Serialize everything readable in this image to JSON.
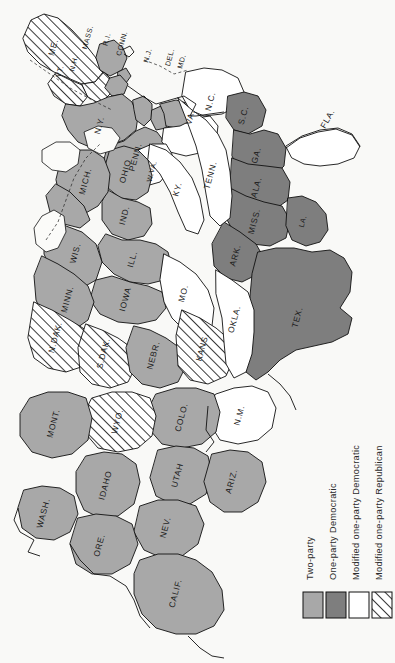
{
  "map": {
    "title": "United States party competition map",
    "orientation": "rotated-90-counterclockwise",
    "background_color": "#f9f9f7",
    "outline_color": "#111111"
  },
  "categories": {
    "two_party": {
      "label": "Two-party",
      "fill": "#a8a8a8",
      "pattern": "solid"
    },
    "one_party_democratic": {
      "label": "One-party Democratic",
      "fill": "#7e7e7e",
      "pattern": "solid"
    },
    "modified_one_party_democratic": {
      "label": "Modified one-party Democratic",
      "fill": "#ffffff",
      "pattern": "solid"
    },
    "modified_one_party_republican": {
      "label": "Modified one-party Republican",
      "fill": "#ffffff",
      "pattern": "diagonal-hatch"
    }
  },
  "legend": {
    "items": [
      {
        "label": "Two-party",
        "category": "two_party",
        "fill": "#a8a8a8"
      },
      {
        "label": "One-party Democratic",
        "category": "one_party_democratic",
        "fill": "#7e7e7e"
      },
      {
        "label": "Modified one-party Democratic",
        "category": "modified_one_party_democratic",
        "fill": "#ffffff"
      },
      {
        "label": "Modified one-party Republican",
        "category": "modified_one_party_republican",
        "fill": "#ffffff"
      }
    ]
  },
  "states": [
    {
      "label": "ME.",
      "category": "modified_one_party_republican"
    },
    {
      "label": "N.H.",
      "category": "modified_one_party_republican"
    },
    {
      "label": "VT.",
      "category": "modified_one_party_republican"
    },
    {
      "label": "MASS.",
      "category": "two_party"
    },
    {
      "label": "R.I.",
      "category": "two_party"
    },
    {
      "label": "CONN.",
      "category": "two_party"
    },
    {
      "label": "N.Y.",
      "category": "two_party"
    },
    {
      "label": "N.J.",
      "category": "two_party"
    },
    {
      "label": "PENN.",
      "category": "two_party"
    },
    {
      "label": "DEL.",
      "category": "two_party"
    },
    {
      "label": "MD.",
      "category": "two_party"
    },
    {
      "label": "VA.",
      "category": "modified_one_party_democratic"
    },
    {
      "label": "W.VA.",
      "category": "modified_one_party_democratic"
    },
    {
      "label": "N.C.",
      "category": "modified_one_party_democratic"
    },
    {
      "label": "S.C.",
      "category": "one_party_democratic"
    },
    {
      "label": "GA.",
      "category": "one_party_democratic"
    },
    {
      "label": "FLA.",
      "category": "modified_one_party_democratic"
    },
    {
      "label": "ALA.",
      "category": "one_party_democratic"
    },
    {
      "label": "MISS.",
      "category": "one_party_democratic"
    },
    {
      "label": "LA.",
      "category": "one_party_democratic"
    },
    {
      "label": "ARK.",
      "category": "one_party_democratic"
    },
    {
      "label": "TEX.",
      "category": "one_party_democratic"
    },
    {
      "label": "TENN.",
      "category": "modified_one_party_democratic"
    },
    {
      "label": "KY.",
      "category": "modified_one_party_democratic"
    },
    {
      "label": "OHIO",
      "category": "two_party"
    },
    {
      "label": "IND.",
      "category": "two_party"
    },
    {
      "label": "ILL.",
      "category": "two_party"
    },
    {
      "label": "MICH.",
      "category": "two_party"
    },
    {
      "label": "WIS.",
      "category": "two_party"
    },
    {
      "label": "MINN.",
      "category": "two_party"
    },
    {
      "label": "IOWA",
      "category": "two_party"
    },
    {
      "label": "MO.",
      "category": "modified_one_party_democratic"
    },
    {
      "label": "N.DAK.",
      "category": "modified_one_party_republican"
    },
    {
      "label": "S.DAK.",
      "category": "modified_one_party_republican"
    },
    {
      "label": "NEBR.",
      "category": "two_party"
    },
    {
      "label": "KANS.",
      "category": "modified_one_party_republican"
    },
    {
      "label": "OKLA.",
      "category": "modified_one_party_democratic"
    },
    {
      "label": "N.M.",
      "category": "modified_one_party_democratic"
    },
    {
      "label": "COLO.",
      "category": "two_party"
    },
    {
      "label": "WYO.",
      "category": "modified_one_party_republican"
    },
    {
      "label": "MONT.",
      "category": "two_party"
    },
    {
      "label": "IDAHO",
      "category": "two_party"
    },
    {
      "label": "UTAH",
      "category": "two_party"
    },
    {
      "label": "ARIZ.",
      "category": "two_party"
    },
    {
      "label": "NEV.",
      "category": "two_party"
    },
    {
      "label": "WASH.",
      "category": "two_party"
    },
    {
      "label": "ORE.",
      "category": "two_party"
    },
    {
      "label": "CALIF.",
      "category": "two_party"
    }
  ]
}
